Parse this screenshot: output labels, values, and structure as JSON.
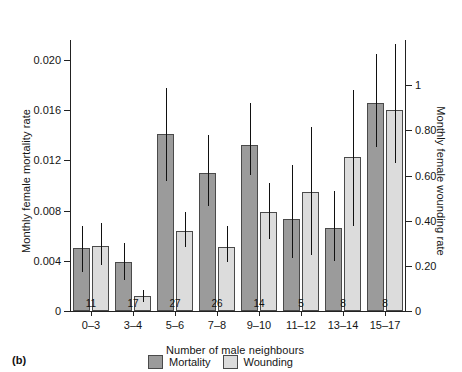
{
  "panel": {
    "label": "(b)"
  },
  "chart_data": {
    "type": "bar",
    "title": "",
    "subtitle": "",
    "xlabel": "Number of male neighbours",
    "ylabel": "Monthly female mortality rate",
    "y2label": "Monthly female wounding rate",
    "categories": [
      "0–3",
      "3–4",
      "5–6",
      "7–8",
      "9–10",
      "11–12",
      "13–14",
      "15–17"
    ],
    "sample_sizes": [
      "11",
      "17",
      "27",
      "26",
      "14",
      "5",
      "8",
      "8"
    ],
    "ylim": [
      0,
      0.0216
    ],
    "ylim_right": [
      0,
      1.2
    ],
    "yticks": [
      0,
      0.004,
      0.008,
      0.012,
      0.016,
      0.02
    ],
    "ytick_labels": [
      "0",
      "0.004",
      "0.008",
      "0.012",
      "0.016",
      "0.020"
    ],
    "yticks_right": [
      0,
      0.2,
      0.4,
      0.6,
      0.8,
      1
    ],
    "ytick_labels_right": [
      "0",
      "0.20",
      "0.40",
      "0.60",
      "0.80",
      "1"
    ],
    "grid": false,
    "legend_position": "bottom-center",
    "series": [
      {
        "name": "Mortality",
        "color": "#9b9b9b",
        "axis": "left",
        "values": [
          0.005,
          0.0039,
          0.0141,
          0.011,
          0.0132,
          0.0073,
          0.0066,
          0.0166
        ],
        "error_low": [
          0.0031,
          0.0025,
          0.0104,
          0.0084,
          0.0108,
          0.0042,
          0.004,
          0.0131
        ],
        "error_high": [
          0.0068,
          0.0054,
          0.0178,
          0.014,
          0.0166,
          0.0116,
          0.0096,
          0.0205
        ]
      },
      {
        "name": "Wounding",
        "color": "#dcdcdc",
        "axis": "right",
        "values": [
          0.0052,
          0.0012,
          0.0064,
          0.0051,
          0.0079,
          0.0095,
          0.0123,
          0.016
        ],
        "error_low": [
          0.0037,
          0.0007,
          0.0051,
          0.0039,
          0.0057,
          0.0045,
          0.0068,
          0.0118
        ],
        "error_high": [
          0.007,
          0.0017,
          0.0079,
          0.0068,
          0.0102,
          0.0147,
          0.0176,
          0.0213
        ]
      }
    ]
  },
  "legend": {
    "items": [
      {
        "label": "Mortality",
        "swatch": "mortality"
      },
      {
        "label": "Wounding",
        "swatch": "wounding"
      }
    ]
  }
}
